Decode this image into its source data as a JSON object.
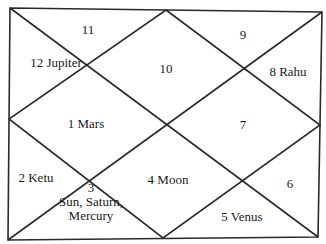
{
  "chart": {
    "type": "north-indian-kundli",
    "houses": [
      {
        "id": "house-1",
        "sign": "1",
        "planets": "Mars",
        "text": "1  Mars"
      },
      {
        "id": "house-2",
        "sign": "2",
        "planets": "Ketu",
        "text": "2  Ketu"
      },
      {
        "id": "house-3",
        "sign": "3",
        "planets": "Sun, Saturn, Mercury",
        "line1": "3",
        "line2": "Sun, Saturn,",
        "line3": "Mercury"
      },
      {
        "id": "house-4",
        "sign": "4",
        "planets": "Moon",
        "text": "4  Moon"
      },
      {
        "id": "house-5",
        "sign": "5",
        "planets": "Venus",
        "text": "5  Venus"
      },
      {
        "id": "house-6",
        "sign": "6",
        "planets": "",
        "text": "6"
      },
      {
        "id": "house-7",
        "sign": "7",
        "planets": "",
        "text": "7"
      },
      {
        "id": "house-8",
        "sign": "8",
        "planets": "Rahu",
        "text": "8  Rahu"
      },
      {
        "id": "house-9",
        "sign": "9",
        "planets": "",
        "text": "9"
      },
      {
        "id": "house-10",
        "sign": "10",
        "planets": "",
        "text": "10"
      },
      {
        "id": "house-11",
        "sign": "11",
        "planets": "",
        "text": "11"
      },
      {
        "id": "house-12",
        "sign": "12",
        "planets": "Jupiter",
        "text": "12 Jupiter"
      }
    ],
    "colors": {
      "line": "#2a2a2a",
      "text": "#1a1a1a",
      "background": "#ffffff"
    }
  }
}
